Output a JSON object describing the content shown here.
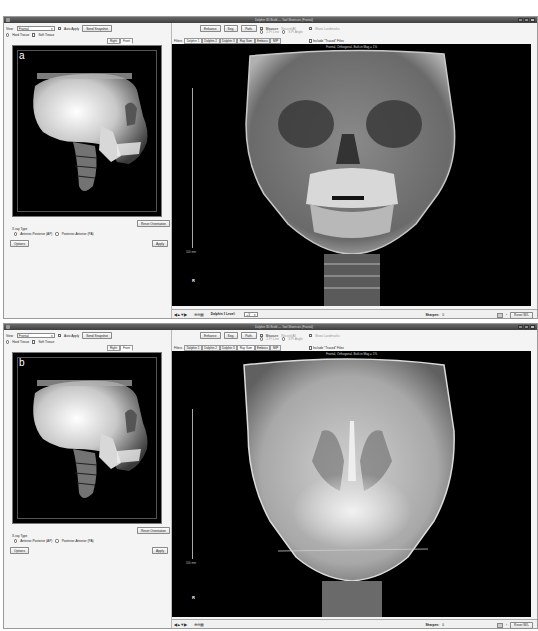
{
  "panels": [
    {
      "letter": "a",
      "titlebar": {
        "title": "Dolphin 3D Build — Tool Shortcuts (Frontal)"
      },
      "left": {
        "view_label": "View:",
        "view_select": "Frontal",
        "auto_apply_label": "Auto Apply",
        "send_snapshot_label": "Send Snapshot",
        "hard_tissue_label": "Hard Tissue",
        "soft_tissue_label": "Soft Tissue",
        "view_tabs": [
          "Right",
          "Front"
        ],
        "reset_orientation_label": "Reset Orientation",
        "xray_type_label": "X-ray Type",
        "ap_label": "Anterior-Posterior (AP)",
        "pa_label": "Posterior-Anterior (PA)",
        "options_label": "Options",
        "apply_label": "Apply"
      },
      "right": {
        "enhance_label": "Enhance",
        "seg_label": "Seg.",
        "path_label": "Path.",
        "measure_label": "Measure",
        "measure_sub_label": "Record All",
        "line_option": "2-Pt Line",
        "angle_option": "3-Pt Angle",
        "show_landmarks_label": "Show Landmarks",
        "filters_label": "Filters",
        "filter_tabs": [
          "Dolphin 1",
          "Dolphin 2",
          "Dolphin 3",
          "Ray Sum",
          "Emboss",
          "MIP"
        ],
        "active_filter": 0,
        "include_traced_label": "Include \"Traced\" Files",
        "image_caption": "Frontal, Orthogonal, Built-in Mag = 1%",
        "scale_label": "100 mm",
        "orientation_marker": "R",
        "nav_icons": "◀▲▼▶",
        "zoom_icons": "⊕⊖▦",
        "filter_level_label": "Dolphin 1 Level:",
        "filter_level_value": "+3",
        "sharpen_label": "Sharpen:",
        "sharpen_value": "0",
        "reset_wl_label": "Reset W/L"
      }
    },
    {
      "letter": "b",
      "titlebar": {
        "title": "Dolphin 3D Build — Tool Shortcuts (Frontal)"
      },
      "left": {
        "view_label": "View:",
        "view_select": "Frontal",
        "auto_apply_label": "Auto Apply",
        "send_snapshot_label": "Send Snapshot",
        "hard_tissue_label": "Hard Tissue",
        "soft_tissue_label": "Soft Tissue",
        "view_tabs": [
          "Right",
          "Front"
        ],
        "reset_orientation_label": "Reset Orientation",
        "xray_type_label": "X-ray Type",
        "ap_label": "Anterior-Posterior (AP)",
        "pa_label": "Posterior-Anterior (PA)",
        "options_label": "Options",
        "apply_label": "Apply"
      },
      "right": {
        "enhance_label": "Enhance",
        "seg_label": "Seg.",
        "path_label": "Path.",
        "measure_label": "Measure",
        "measure_sub_label": "Record All",
        "line_option": "2-Pt Line",
        "angle_option": "3-Pt Angle",
        "show_landmarks_label": "Show Landmarks",
        "filters_label": "Filters",
        "filter_tabs": [
          "Dolphin 1",
          "Dolphin 2",
          "Dolphin 3",
          "Ray Sum",
          "Emboss",
          "MIP"
        ],
        "active_filter": 3,
        "include_traced_label": "Include \"Traced\" Files",
        "image_caption": "Frontal, Orthogonal, Built-in Mag = 1%",
        "scale_label": "100 mm",
        "orientation_marker": "R",
        "nav_icons": "◀▲▼▶",
        "zoom_icons": "⊕⊖▦",
        "sharpen_label": "Sharpen:",
        "sharpen_value": "0",
        "reset_wl_label": "Reset W/L"
      }
    }
  ],
  "colors": {
    "titlebar": "#4a4a4a",
    "viewport_bg": "#000000",
    "chrome_bg": "#f0f0f0"
  }
}
